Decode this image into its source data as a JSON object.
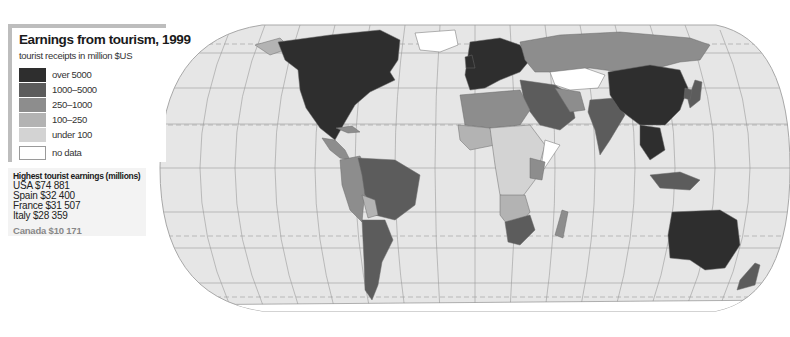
{
  "legend": {
    "title": "Earnings from tourism, 1999",
    "subtitle": "tourist receipts in million $US",
    "categories": [
      {
        "label": "over 5000",
        "color": "#2e2e2e"
      },
      {
        "label": "1000–5000",
        "color": "#5c5c5c"
      },
      {
        "label": "250–1000",
        "color": "#8d8d8d"
      },
      {
        "label": "100–250",
        "color": "#b3b3b3"
      },
      {
        "label": "under 100",
        "color": "#d3d3d3"
      },
      {
        "label": "no data",
        "color": "#ffffff"
      }
    ]
  },
  "stats": {
    "title": "Highest tourist earnings (millions)",
    "rows": [
      "USA $74 881",
      "Spain $32 400",
      "France $31 507",
      "Italy $28 359"
    ],
    "extra": "Canada $10 171"
  },
  "map": {
    "ocean_color": "#e6e6e6",
    "graticule_color": "#9a9a9a",
    "regions": [
      {
        "name": "North America (USA, Canada, Mexico)",
        "category": "over 5000"
      },
      {
        "name": "Central America",
        "category": "250–1000"
      },
      {
        "name": "Caribbean",
        "category": "250–1000"
      },
      {
        "name": "Brazil",
        "category": "1000–5000"
      },
      {
        "name": "Argentina",
        "category": "1000–5000"
      },
      {
        "name": "Andean countries",
        "category": "250–1000"
      },
      {
        "name": "Western Europe",
        "category": "over 5000"
      },
      {
        "name": "Russia",
        "category": "250–1000"
      },
      {
        "name": "Kazakhstan / Central Asia",
        "category": "no data"
      },
      {
        "name": "China",
        "category": "over 5000"
      },
      {
        "name": "India",
        "category": "1000–5000"
      },
      {
        "name": "Saudi Arabia / Middle East",
        "category": "1000–5000"
      },
      {
        "name": "North Africa",
        "category": "250–1000"
      },
      {
        "name": "Sub-Saharan Africa",
        "category": "under 100"
      },
      {
        "name": "South Africa",
        "category": "1000–5000"
      },
      {
        "name": "Southeast Asia",
        "category": "1000–5000"
      },
      {
        "name": "Australia",
        "category": "over 5000"
      },
      {
        "name": "New Zealand",
        "category": "1000–5000"
      },
      {
        "name": "Greenland",
        "category": "no data"
      },
      {
        "name": "Antarctica",
        "category": "no data"
      }
    ]
  }
}
